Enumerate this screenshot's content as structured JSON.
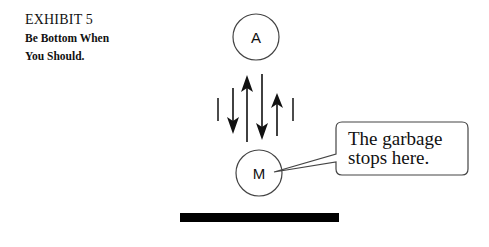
{
  "exhibit": {
    "number": "EXHIBIT 5",
    "title_line1": "Be Bottom When",
    "title_line2": "You Should."
  },
  "diagram": {
    "nodes": [
      {
        "id": "top",
        "label": "A"
      },
      {
        "id": "bottom",
        "label": "M"
      }
    ],
    "arrows": [
      {
        "direction": "down",
        "length": "short"
      },
      {
        "direction": "up",
        "length": "long"
      },
      {
        "direction": "down",
        "length": "long"
      },
      {
        "direction": "up",
        "length": "short"
      }
    ],
    "callout": {
      "line1": "The garbage",
      "line2": "stops here."
    },
    "colors": {
      "ink": "#111111",
      "circle_stroke": "#333333",
      "bar": "#000000"
    }
  }
}
